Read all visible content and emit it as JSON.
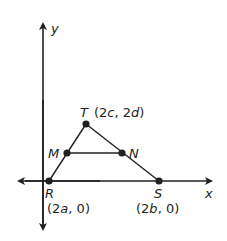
{
  "diagram": {
    "type": "coordinate-geometry",
    "axes": {
      "x_label": "x",
      "y_label": "y"
    },
    "points": [
      {
        "name": "R",
        "label": "R",
        "coord_text": "(2a, 0)"
      },
      {
        "name": "S",
        "label": "S",
        "coord_text": "(2b, 0)"
      },
      {
        "name": "T",
        "label": "T",
        "coord_text": "(2c, 2d)"
      },
      {
        "name": "M",
        "label": "M",
        "coord_text": ""
      },
      {
        "name": "N",
        "label": "N",
        "coord_text": ""
      }
    ],
    "segments": [
      "RT",
      "TS",
      "RS",
      "MN"
    ],
    "colors": {
      "stroke": "#231f20",
      "background": "#ffffff"
    }
  }
}
